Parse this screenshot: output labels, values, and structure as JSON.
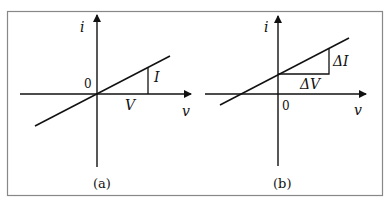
{
  "figure": {
    "panels": [
      {
        "caption": "(a)",
        "y_axis_label": "i",
        "x_axis_label": "v",
        "origin_label": "0",
        "rise_label": "I",
        "run_label": "V"
      },
      {
        "caption": "(b)",
        "y_axis_label": "i",
        "x_axis_label": "v",
        "origin_label": "0",
        "rise_label": "ΔI",
        "run_label": "ΔV"
      }
    ],
    "colors": {
      "line": "#111111",
      "border": "#888888"
    }
  }
}
